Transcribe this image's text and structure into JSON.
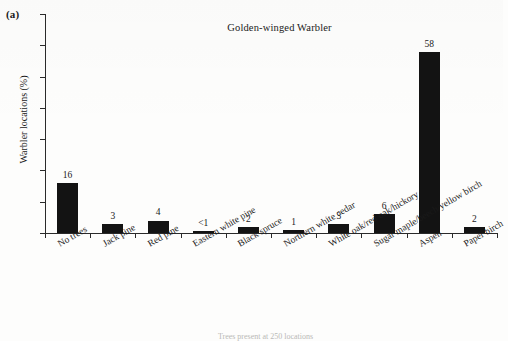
{
  "figure": {
    "panel_letter": "(a)",
    "bottom_caption": "Trees present at 250 locations"
  },
  "chart_data": {
    "type": "bar",
    "title": "Golden-winged Warbler",
    "xlabel": "",
    "ylabel": "Warbler locations (%)",
    "ylim": [
      0,
      70
    ],
    "yticks": [
      0,
      10,
      20,
      30,
      40,
      50,
      60,
      70
    ],
    "grid": false,
    "legend": null,
    "bar_color": "#131313",
    "categories": [
      "No trees",
      "Jack pine",
      "Red pine",
      "Eastern white pine",
      "Black spruce",
      "Northern white cedar",
      "White oak/red oak/hickory",
      "Sugar maple/beech/yellow birch",
      "Aspen",
      "Paper birch"
    ],
    "values": [
      16,
      3,
      4,
      0.3,
      2,
      1,
      3,
      6,
      58,
      2
    ],
    "value_labels": [
      "16",
      "3",
      "4",
      "<1",
      "2",
      "1",
      "3",
      "6",
      "58",
      "2"
    ]
  }
}
